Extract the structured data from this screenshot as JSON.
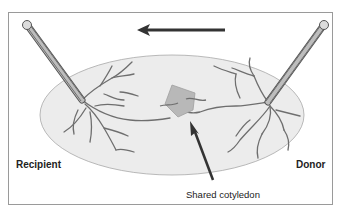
{
  "diagram": {
    "labels": {
      "recipient": "Recipient",
      "donor": "Donor",
      "shared_cotyledon": "Shared cotyledon"
    },
    "flow_direction": "donor-to-recipient (right to left)",
    "colors": {
      "frame": "#9a9a9a",
      "placenta_fill": "#ececec",
      "placenta_edge": "#a8a8a8",
      "vessel": "#6e6e6e",
      "cotyledon": "#b8b8b8",
      "arrow": "#333333",
      "cord": "#7a7a7a"
    }
  }
}
